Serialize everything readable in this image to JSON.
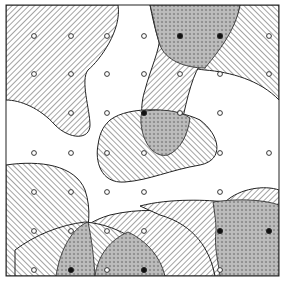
{
  "figure": {
    "frame": {
      "x": 6,
      "y": 5,
      "width": 273,
      "height": 271
    },
    "colors": {
      "stroke": "#222222",
      "background": "#ffffff",
      "hatch": "#333333"
    },
    "grid": {
      "columns": [
        34,
        71,
        107,
        144,
        180,
        220,
        269
      ],
      "rows": [
        36,
        74,
        113,
        153,
        192,
        231,
        270
      ]
    },
    "points": [
      {
        "x": 34,
        "y": 36,
        "filled": false
      },
      {
        "x": 71,
        "y": 36,
        "filled": false
      },
      {
        "x": 107,
        "y": 36,
        "filled": false
      },
      {
        "x": 144,
        "y": 36,
        "filled": false
      },
      {
        "x": 180,
        "y": 36,
        "filled": true
      },
      {
        "x": 220,
        "y": 36,
        "filled": true
      },
      {
        "x": 269,
        "y": 36,
        "filled": false
      },
      {
        "x": 34,
        "y": 74,
        "filled": false
      },
      {
        "x": 71,
        "y": 74,
        "filled": false
      },
      {
        "x": 107,
        "y": 74,
        "filled": false
      },
      {
        "x": 144,
        "y": 74,
        "filled": false
      },
      {
        "x": 180,
        "y": 74,
        "filled": false
      },
      {
        "x": 220,
        "y": 74,
        "filled": false
      },
      {
        "x": 269,
        "y": 74,
        "filled": false
      },
      {
        "x": 71,
        "y": 113,
        "filled": false
      },
      {
        "x": 107,
        "y": 113,
        "filled": false
      },
      {
        "x": 144,
        "y": 113,
        "filled": true
      },
      {
        "x": 180,
        "y": 113,
        "filled": false
      },
      {
        "x": 220,
        "y": 113,
        "filled": false
      },
      {
        "x": 34,
        "y": 153,
        "filled": false
      },
      {
        "x": 71,
        "y": 153,
        "filled": false
      },
      {
        "x": 107,
        "y": 153,
        "filled": false
      },
      {
        "x": 144,
        "y": 153,
        "filled": false
      },
      {
        "x": 220,
        "y": 153,
        "filled": false
      },
      {
        "x": 269,
        "y": 153,
        "filled": false
      },
      {
        "x": 34,
        "y": 192,
        "filled": false
      },
      {
        "x": 71,
        "y": 192,
        "filled": false
      },
      {
        "x": 107,
        "y": 192,
        "filled": false
      },
      {
        "x": 144,
        "y": 192,
        "filled": false
      },
      {
        "x": 220,
        "y": 192,
        "filled": false
      },
      {
        "x": 34,
        "y": 231,
        "filled": false
      },
      {
        "x": 71,
        "y": 231,
        "filled": false
      },
      {
        "x": 107,
        "y": 231,
        "filled": false
      },
      {
        "x": 144,
        "y": 231,
        "filled": false
      },
      {
        "x": 220,
        "y": 231,
        "filled": true
      },
      {
        "x": 269,
        "y": 231,
        "filled": true
      },
      {
        "x": 34,
        "y": 270,
        "filled": false
      },
      {
        "x": 71,
        "y": 270,
        "filled": true
      },
      {
        "x": 107,
        "y": 270,
        "filled": false
      },
      {
        "x": 144,
        "y": 270,
        "filled": true
      },
      {
        "x": 220,
        "y": 270,
        "filled": false
      }
    ],
    "regions": [
      {
        "name": "top-left-region",
        "hatch": "forward",
        "path": "M6,5 L118,5 C122,30 100,60 88,70 C80,80 90,110 90,125 C90,140 70,140 55,125 C40,108 20,100 6,100 Z"
      },
      {
        "name": "top-right-region",
        "hatch": "back",
        "path": "M192,5 L279,5 L279,100 C260,80 230,72 205,70 C185,68 165,60 160,45 C155,30 152,15 150,5 Z"
      },
      {
        "name": "vertical-band-region",
        "hatch": "forward",
        "path": "M150,5 L240,5 C235,30 215,50 200,65 C190,80 185,110 180,130 C175,145 160,150 150,140 C140,125 140,105 145,90 C150,70 160,50 160,35 C158,20 155,10 150,5 Z"
      },
      {
        "name": "center-blob-region",
        "hatch": "back",
        "path": "M110,120 C130,105 175,108 200,120 C220,135 225,160 200,165 C170,170 150,180 125,182 C100,184 95,160 98,145 C100,130 105,125 110,120 Z"
      },
      {
        "name": "bottom-left-region",
        "hatch": "back",
        "path": "M6,165 C40,160 75,165 85,190 C92,210 88,230 85,240 C70,250 60,265 56,276 L6,276 Z"
      },
      {
        "name": "bottom-center-region",
        "hatch": "forward",
        "path": "M56,276 C60,250 75,225 110,215 C140,208 165,210 185,215 C200,220 210,250 215,276 Z"
      },
      {
        "name": "bottom-mid-region",
        "hatch": "back",
        "path": "M15,250 C35,235 60,225 85,222 C120,225 150,245 165,276 L15,276 Z"
      },
      {
        "name": "bottom-right-region",
        "hatch": "forward",
        "path": "M140,206 C170,198 210,200 225,202 C240,188 265,185 279,190 L279,276 L215,276 C210,250 195,225 160,215 Z"
      }
    ],
    "crosshatch_regions": [
      {
        "name": "top-crosshatch-overlap",
        "path": "M150,5 L240,5 C236,30 218,52 205,68 C185,68 165,60 160,45 C155,30 153,15 150,5 Z"
      },
      {
        "name": "center-crosshatch-overlap",
        "path": "M142,112 C155,108 180,110 190,118 C188,135 180,150 168,155 C155,158 145,145 142,130 C140,120 141,115 142,112 Z"
      },
      {
        "name": "bottom-left-crosshatch-overlap",
        "path": "M56,276 C60,250 72,228 88,222 C92,240 94,260 95,276 Z"
      },
      {
        "name": "bottom-center-crosshatch-overlap",
        "path": "M95,276 C98,255 110,240 128,232 C145,240 160,255 165,276 Z"
      },
      {
        "name": "bottom-right-crosshatch-overlap",
        "path": "M213,202 C240,198 265,200 279,205 L279,276 L220,276 C218,260 214,248 216,230 C216,220 214,210 213,202 Z"
      }
    ]
  }
}
